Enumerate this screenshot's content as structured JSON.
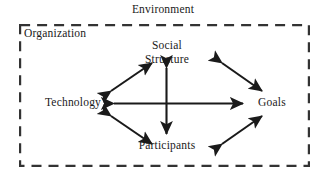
{
  "diagram": {
    "type": "organizational-systems-model",
    "outer_label": "Environment",
    "boundary_label": "Organization",
    "boundary_style": "dashed",
    "colors": {
      "ink": "#1a1a1a",
      "background": "#ffffff",
      "boundary": "#333333"
    },
    "nodes": [
      {
        "id": "social-structure",
        "line1": "Social",
        "line2": "Structure",
        "position": "top"
      },
      {
        "id": "technology",
        "line1": "Technology",
        "line2": "",
        "position": "left"
      },
      {
        "id": "goals",
        "line1": "Goals",
        "line2": "",
        "position": "right"
      },
      {
        "id": "participants",
        "line1": "Participants",
        "line2": "",
        "position": "bottom"
      }
    ],
    "connections": [
      {
        "id": "technology-goals",
        "from": "technology",
        "to": "goals",
        "style": "double-headed",
        "orientation": "horizontal"
      },
      {
        "id": "social-structure-participants",
        "from": "social-structure",
        "to": "participants",
        "style": "double-headed",
        "orientation": "vertical"
      },
      {
        "id": "technology-social-structure",
        "from": "technology",
        "to": "social-structure",
        "style": "double-headed",
        "orientation": "diagonal"
      },
      {
        "id": "social-structure-goals",
        "from": "social-structure",
        "to": "goals",
        "style": "double-headed",
        "orientation": "diagonal"
      },
      {
        "id": "technology-participants",
        "from": "technology",
        "to": "participants",
        "style": "double-headed",
        "orientation": "diagonal"
      },
      {
        "id": "participants-goals",
        "from": "participants",
        "to": "goals",
        "style": "double-headed",
        "orientation": "diagonal"
      }
    ]
  }
}
